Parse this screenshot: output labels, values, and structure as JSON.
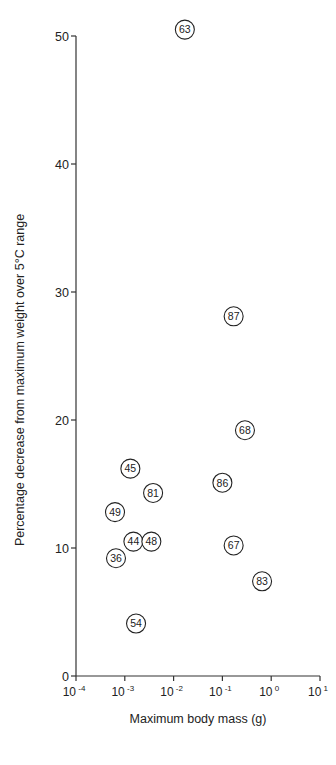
{
  "chart_data": {
    "type": "scatter",
    "title": "",
    "xlabel": "Maximum body mass (g)",
    "ylabel": "Percentage decrease from maximum weight over 5°C range",
    "xscale": "log",
    "xlim": [
      0.0001,
      10
    ],
    "ylim": [
      0,
      50
    ],
    "x_ticks": [
      {
        "value": 0.0001,
        "base": "10",
        "exp": "-4"
      },
      {
        "value": 0.001,
        "base": "10",
        "exp": "-3"
      },
      {
        "value": 0.01,
        "base": "10",
        "exp": "-2"
      },
      {
        "value": 0.1,
        "base": "10",
        "exp": "-1"
      },
      {
        "value": 1,
        "base": "10",
        "exp": "0"
      },
      {
        "value": 10,
        "base": "10",
        "exp": "1"
      }
    ],
    "y_ticks": [
      0,
      10,
      20,
      30,
      40,
      50
    ],
    "grid": false,
    "legend": null,
    "marker": "circle with label",
    "points": [
      {
        "label": "63",
        "x": 0.017,
        "y": 50.5
      },
      {
        "label": "87",
        "x": 0.17,
        "y": 28.1
      },
      {
        "label": "68",
        "x": 0.29,
        "y": 19.2
      },
      {
        "label": "45",
        "x": 0.0013,
        "y": 16.2
      },
      {
        "label": "86",
        "x": 0.1,
        "y": 15.1
      },
      {
        "label": "81",
        "x": 0.0038,
        "y": 14.3
      },
      {
        "label": "49",
        "x": 0.00063,
        "y": 12.8
      },
      {
        "label": "44",
        "x": 0.0015,
        "y": 10.5
      },
      {
        "label": "48",
        "x": 0.0035,
        "y": 10.5
      },
      {
        "label": "67",
        "x": 0.17,
        "y": 10.2
      },
      {
        "label": "36",
        "x": 0.00066,
        "y": 9.2
      },
      {
        "label": "83",
        "x": 0.65,
        "y": 7.4
      },
      {
        "label": "54",
        "x": 0.0017,
        "y": 4.1
      }
    ]
  }
}
